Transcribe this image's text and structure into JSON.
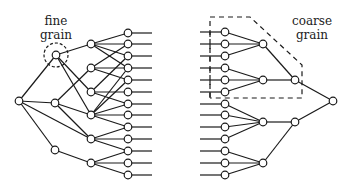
{
  "labels": {
    "fine": [
      "fine",
      "grain"
    ],
    "coarse": [
      "coarse",
      "grain"
    ]
  },
  "colors": {
    "stroke": "#1a1a1a",
    "node_fill": "#ffffff",
    "background": "#ffffff"
  },
  "left_tree": {
    "root": [
      19,
      101
    ],
    "level1": [
      [
        56,
        55
      ],
      [
        55,
        103
      ],
      [
        55,
        150
      ]
    ],
    "level2": [
      [
        91,
        44
      ],
      [
        91,
        68
      ],
      [
        91,
        92
      ],
      [
        91,
        115
      ],
      [
        91,
        139
      ],
      [
        91,
        163
      ]
    ],
    "leaves_x": 128,
    "leaves_y": [
      33,
      44,
      56,
      68,
      80,
      92,
      104,
      115,
      127,
      139,
      151,
      163,
      175
    ]
  },
  "right_tree": {
    "leaves_x": 225,
    "leaves_y": [
      32,
      44,
      56,
      68,
      80,
      92,
      104,
      115,
      127,
      139,
      151,
      163,
      175
    ],
    "group": [
      [
        263,
        44
      ],
      [
        263,
        80
      ],
      [
        263,
        122
      ],
      [
        263,
        163
      ]
    ],
    "level2": [
      [
        295,
        80
      ],
      [
        295,
        122
      ]
    ],
    "root": [
      333,
      101
    ]
  }
}
